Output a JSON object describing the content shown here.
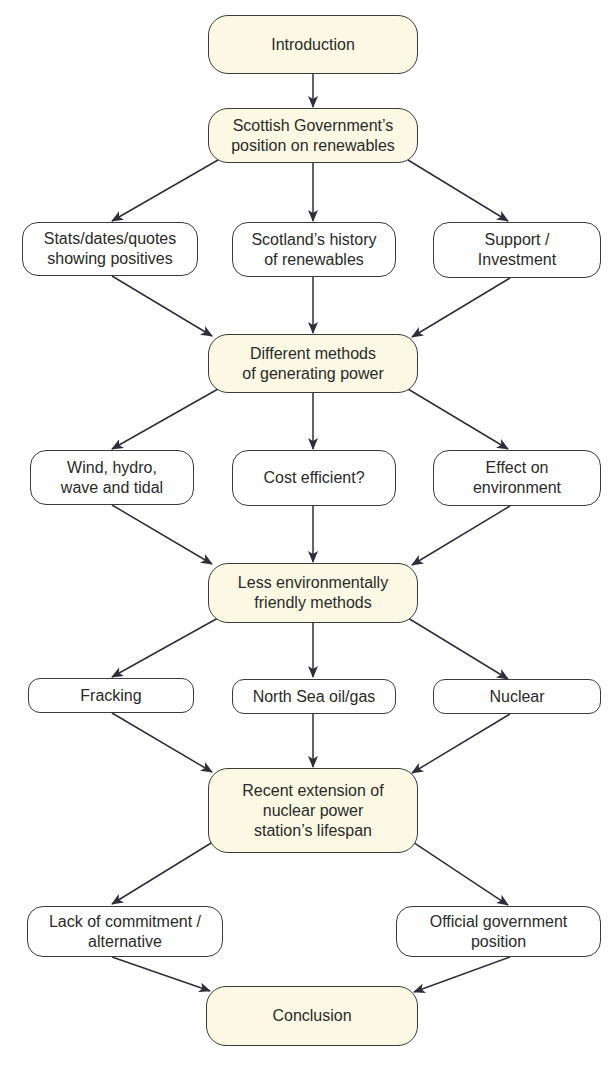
{
  "diagram": {
    "type": "flowchart",
    "colors": {
      "main_fill": "#fbf9e3",
      "sub_fill": "#ffffff",
      "stroke": "#3a3a3a",
      "text": "#2a2a2a"
    },
    "nodes": {
      "introduction": "Introduction",
      "gov_position": "Scottish Government’s\nposition on renewables",
      "stats": "Stats/dates/quotes\nshowing positives",
      "history": "Scotland’s history\nof renewables",
      "support": "Support /\nInvestment",
      "methods": "Different methods\nof generating power",
      "wind": "Wind, hydro,\nwave and tidal",
      "cost": "Cost efficient?",
      "effect": "Effect on\nenvironment",
      "less_friendly": "Less environmentally\nfriendly methods",
      "fracking": "Fracking",
      "north_sea": "North Sea oil/gas",
      "nuclear": "Nuclear",
      "extension": "Recent extension of\nnuclear power\nstation’s lifespan",
      "lack_commitment": "Lack of commitment /\nalternative",
      "official_position": "Official government\nposition",
      "conclusion": "Conclusion"
    },
    "edges": [
      [
        "introduction",
        "gov_position"
      ],
      [
        "gov_position",
        "stats"
      ],
      [
        "gov_position",
        "history"
      ],
      [
        "gov_position",
        "support"
      ],
      [
        "stats",
        "methods"
      ],
      [
        "history",
        "methods"
      ],
      [
        "support",
        "methods"
      ],
      [
        "methods",
        "wind"
      ],
      [
        "methods",
        "cost"
      ],
      [
        "methods",
        "effect"
      ],
      [
        "wind",
        "less_friendly"
      ],
      [
        "cost",
        "less_friendly"
      ],
      [
        "effect",
        "less_friendly"
      ],
      [
        "less_friendly",
        "fracking"
      ],
      [
        "less_friendly",
        "north_sea"
      ],
      [
        "less_friendly",
        "nuclear"
      ],
      [
        "fracking",
        "extension"
      ],
      [
        "north_sea",
        "extension"
      ],
      [
        "nuclear",
        "extension"
      ],
      [
        "extension",
        "lack_commitment"
      ],
      [
        "extension",
        "official_position"
      ],
      [
        "lack_commitment",
        "conclusion"
      ],
      [
        "official_position",
        "conclusion"
      ]
    ]
  }
}
